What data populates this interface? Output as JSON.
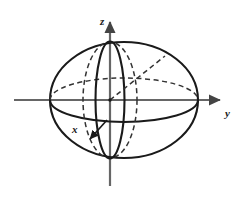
{
  "figure": {
    "background_color": "#ffffff",
    "stroke_color": "#1a1a1a",
    "axis_color": "#555555",
    "width": 246,
    "height": 199
  },
  "axes": {
    "origin": {
      "x": 110,
      "y": 100
    },
    "z": {
      "label": "z",
      "label_x": 100,
      "label_y": 21,
      "line": {
        "x1": 110,
        "y1": 186,
        "x2": 110,
        "y2": 16
      },
      "arrow": "up",
      "direction": "vertical-up"
    },
    "y": {
      "label": "y",
      "label_x": 228,
      "label_y": 115,
      "line": {
        "x1": 14,
        "y1": 100,
        "x2": 226,
        "y2": 100
      },
      "arrow": "right",
      "direction": "horizontal-right"
    },
    "x": {
      "label": "x",
      "label_x": 74,
      "label_y": 133,
      "line": {
        "x1": 107,
        "y1": 120,
        "x2": 89,
        "y2": 140
      },
      "arrow": "down-left",
      "direction": "toward-viewer"
    }
  },
  "sphere": {
    "outline": {
      "name": "outer-ellipse",
      "cx": 124,
      "cy": 100,
      "rx": 74,
      "ry": 58,
      "style": "solid"
    },
    "equator": {
      "name": "equator-ellipse",
      "cx": 124,
      "cy": 100,
      "rx": 74,
      "ry": 22,
      "back_half": "dashed",
      "front_half": "solid"
    },
    "meridian_front": {
      "name": "front-meridian",
      "cx": 110,
      "cy": 100,
      "rx": 14,
      "ry": 58,
      "style": "solid"
    },
    "meridian_back": {
      "name": "back-meridian",
      "cx": 110,
      "cy": 100,
      "rx": 27,
      "ry": 58,
      "style": "dashed"
    },
    "radius_line": {
      "name": "radius-dashed",
      "x1": 110,
      "y1": 100,
      "x2": 164,
      "y2": 57,
      "style": "dashed"
    },
    "center_dot": {
      "cx": 110,
      "cy": 100,
      "r": 1.6
    }
  }
}
